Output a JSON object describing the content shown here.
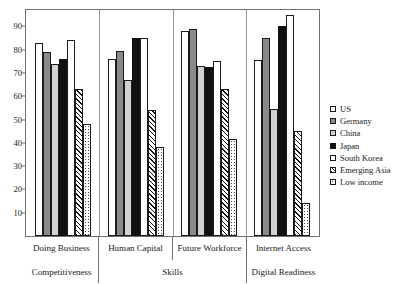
{
  "title_sliver": "· ·",
  "axis": {
    "yticks": [
      10,
      20,
      30,
      40,
      50,
      60,
      70,
      80,
      90
    ],
    "ymin": 0,
    "ymax": 97
  },
  "legend": {
    "position": "right",
    "items": [
      {
        "label": "US",
        "pattern": "open-white"
      },
      {
        "label": "Germany",
        "pattern": "solid-dark-gray"
      },
      {
        "label": "China",
        "pattern": "solid-light-gray"
      },
      {
        "label": "Japan",
        "pattern": "solid-black"
      },
      {
        "label": "South Korea",
        "pattern": "open-white"
      },
      {
        "label": "Emerging Asia",
        "pattern": "diagonal-hatch"
      },
      {
        "label": "Low income",
        "pattern": "dotted"
      }
    ]
  },
  "xlabels": {
    "row1": [
      "Doing Business",
      "Human Capital",
      "Future Workforce",
      "Internet Access"
    ],
    "row2": [
      "Competitiveness",
      "Skills",
      "Digital Readiness"
    ],
    "row2_spans": [
      1,
      2,
      1
    ]
  },
  "colors": {
    "us": "#ffffff",
    "germany": "#8a8a8a",
    "china": "#d2d2d2",
    "japan": "#111111",
    "south_korea": "#ffffff",
    "emerging_asia": "#111111",
    "low_income": "#4a4a4a",
    "axis": "#6f6f6f",
    "text": "#1a1a1a"
  },
  "chart_data": {
    "type": "bar",
    "title": "",
    "xlabel": "",
    "ylabel": "",
    "ylim": [
      0,
      97
    ],
    "grid": false,
    "legend_position": "right",
    "categories": [
      "Doing Business / Competitiveness",
      "Human Capital / Skills",
      "Future Workforce / Skills",
      "Internet Access / Digital Readiness"
    ],
    "series": [
      {
        "name": "US",
        "values": [
          83,
          76,
          88,
          75.5
        ]
      },
      {
        "name": "Germany",
        "values": [
          79,
          79.5,
          89,
          85
        ]
      },
      {
        "name": "China",
        "values": [
          74,
          67,
          73,
          54.5
        ]
      },
      {
        "name": "Japan",
        "values": [
          76,
          85,
          72.5,
          90
        ]
      },
      {
        "name": "South Korea",
        "values": [
          84,
          85,
          75,
          95
        ]
      },
      {
        "name": "Emerging Asia",
        "values": [
          63,
          54,
          63,
          45
        ]
      },
      {
        "name": "Low income",
        "values": [
          48,
          38,
          41.5,
          14
        ]
      }
    ]
  }
}
